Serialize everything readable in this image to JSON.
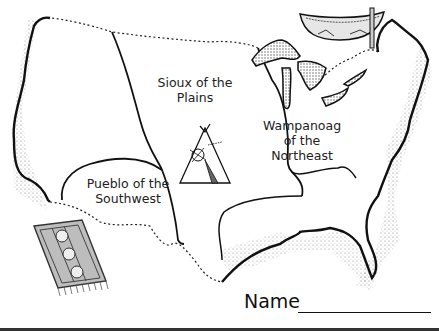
{
  "map": {
    "regions": [
      {
        "id": "sioux",
        "label_line1": "Sioux of the",
        "label_line2": "Plains"
      },
      {
        "id": "wampanoag",
        "label_line1": "Wampanoag",
        "label_line2": "of the",
        "label_line3": "Northeast"
      },
      {
        "id": "pueblo",
        "label_line1": "Pueblo of the",
        "label_line2": "Southwest"
      }
    ],
    "illustrations": [
      "canoe-icon",
      "teepee-icon",
      "rug-icon"
    ]
  },
  "footer": {
    "name_label": "Name"
  },
  "colors": {
    "ink": "#111111",
    "background": "#ffffff"
  }
}
